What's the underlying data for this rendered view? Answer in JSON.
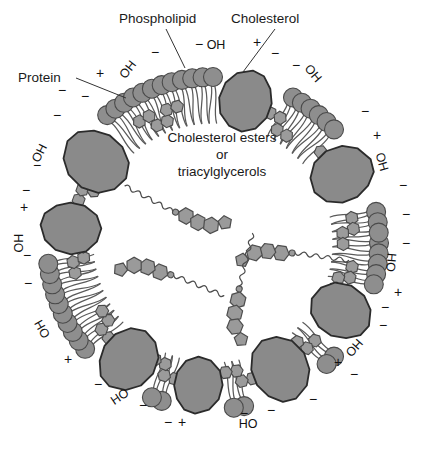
{
  "figure": {
    "kind": "lipoprotein-particle-cross-section",
    "background_color": "#ffffff",
    "colors": {
      "protein_fill": "#8a8a8a",
      "protein_stroke": "#2b2b2b",
      "phospholipid_head_fill": "#8e8e8e",
      "phospholipid_head_stroke": "#4a4a4a",
      "phospholipid_tail_stroke": "#5a5a5a",
      "cholesterol_fill": "#9b9b9b",
      "cholesterol_stroke": "#4a4a4a",
      "ester_fill": "#9a9a9a",
      "ester_stroke": "#4d4d4d",
      "text": "#1a1a1a",
      "leader_line": "#333333"
    },
    "geometry": {
      "center_x": 213,
      "center_y": 243,
      "head_ring_radius": 166,
      "head_radius": 9.5,
      "tail_length": 46
    }
  },
  "callout_labels": [
    {
      "id": "protein",
      "text": "Protein",
      "x": 18,
      "y": 82,
      "leader": "M 76,78 L 126,98"
    },
    {
      "id": "phospholipid",
      "text": "Phospholipid",
      "x": 119,
      "y": 23,
      "leader": "M 166,29 L 185,68"
    },
    {
      "id": "cholesterol",
      "text": "Cholesterol",
      "x": 231,
      "y": 23,
      "leader": "M 275,29 L 243,72"
    }
  ],
  "center_text": {
    "line1": "Cholesterol esters",
    "line2": "or",
    "line3": "triacylglycerols",
    "x": 222,
    "y1": 142,
    "y2": 159,
    "y3": 176
  },
  "hydroxyl_labels": [
    {
      "text": "OH",
      "x": 131,
      "y": 72,
      "rot": -52
    },
    {
      "text": "OH",
      "x": 216,
      "y": 49,
      "rot": 0
    },
    {
      "text": "OH",
      "x": 310,
      "y": 76,
      "rot": 50
    },
    {
      "text": "OH",
      "x": 378,
      "y": 163,
      "rot": 74
    },
    {
      "text": "HO",
      "x": 387,
      "y": 262,
      "rot": 95
    },
    {
      "text": "HO",
      "x": 351,
      "y": 345,
      "rot": 131
    },
    {
      "text": "HO",
      "x": 248,
      "y": 428,
      "rot": 0
    },
    {
      "text": "HO",
      "x": 122,
      "y": 400,
      "rot": -34
    },
    {
      "text": "OH",
      "x": 46,
      "y": 327,
      "rot": -119
    },
    {
      "text": "OH",
      "x": 23,
      "y": 243,
      "rot": -90
    },
    {
      "text": "OH",
      "x": 43,
      "y": 155,
      "rot": -63
    }
  ],
  "charges": [
    {
      "sign": "+",
      "x": 100,
      "y": 78
    },
    {
      "sign": "−",
      "x": 155,
      "y": 57
    },
    {
      "sign": "−",
      "x": 199,
      "y": 49
    },
    {
      "sign": "+",
      "x": 257,
      "y": 47
    },
    {
      "sign": "−",
      "x": 275,
      "y": 58
    },
    {
      "sign": "−",
      "x": 296,
      "y": 70
    },
    {
      "sign": "−",
      "x": 365,
      "y": 116
    },
    {
      "sign": "+",
      "x": 377,
      "y": 140
    },
    {
      "sign": "−",
      "x": 403,
      "y": 190
    },
    {
      "sign": "−",
      "x": 406,
      "y": 219
    },
    {
      "sign": "−",
      "x": 406,
      "y": 248
    },
    {
      "sign": "+",
      "x": 398,
      "y": 297
    },
    {
      "sign": "−",
      "x": 385,
      "y": 312
    },
    {
      "sign": "−",
      "x": 383,
      "y": 330
    },
    {
      "sign": "−",
      "x": 354,
      "y": 379
    },
    {
      "sign": "+",
      "x": 338,
      "y": 367
    },
    {
      "sign": "−",
      "x": 313,
      "y": 404
    },
    {
      "sign": "−",
      "x": 271,
      "y": 415
    },
    {
      "sign": "−",
      "x": 244,
      "y": 418
    },
    {
      "sign": "+",
      "x": 182,
      "y": 427
    },
    {
      "sign": "−",
      "x": 168,
      "y": 427
    },
    {
      "sign": "−",
      "x": 143,
      "y": 410
    },
    {
      "sign": "−",
      "x": 98,
      "y": 389
    },
    {
      "sign": "+",
      "x": 68,
      "y": 364
    },
    {
      "sign": "−",
      "x": 28,
      "y": 288
    },
    {
      "sign": "−",
      "x": 27,
      "y": 260
    },
    {
      "sign": "+",
      "x": 24,
      "y": 212
    },
    {
      "sign": "−",
      "x": 26,
      "y": 195
    },
    {
      "sign": "−",
      "x": 37,
      "y": 170
    },
    {
      "sign": "−",
      "x": 57,
      "y": 120
    },
    {
      "sign": "−",
      "x": 62,
      "y": 95
    },
    {
      "sign": "−",
      "x": 85,
      "y": 101
    }
  ],
  "proteins": [
    {
      "id": "protein-nw",
      "angle_deg": 215,
      "radius": 160,
      "scale": 1.12,
      "rot": -45
    },
    {
      "id": "protein-n",
      "angle_deg": 283,
      "radius": 163,
      "scale": 1.0,
      "rot": 12
    },
    {
      "id": "protein-ne",
      "angle_deg": 332,
      "radius": 163,
      "scale": 1.05,
      "rot": 58
    },
    {
      "id": "protein-e",
      "angle_deg": 28,
      "radius": 162,
      "scale": 1.02,
      "rot": 110
    },
    {
      "id": "protein-se",
      "angle_deg": 62,
      "radius": 160,
      "scale": 1.08,
      "rot": 150
    },
    {
      "id": "protein-s",
      "angle_deg": 96,
      "radius": 160,
      "scale": 0.92,
      "rot": 190
    },
    {
      "id": "protein-sw",
      "angle_deg": 126,
      "radius": 161,
      "scale": 1.06,
      "rot": 222
    },
    {
      "id": "protein-w",
      "angle_deg": 186,
      "radius": 160,
      "scale": 0.98,
      "rot": 275
    }
  ],
  "membrane_cholesterols": [
    {
      "angle_deg": 241,
      "inset": 24
    },
    {
      "angle_deg": 247,
      "inset": 36
    },
    {
      "angle_deg": 253,
      "inset": 25
    },
    {
      "angle_deg": 296,
      "inset": 24
    },
    {
      "angle_deg": 302,
      "inset": 36
    },
    {
      "angle_deg": 322,
      "inset": 25
    },
    {
      "angle_deg": 328,
      "inset": 36
    },
    {
      "angle_deg": 352,
      "inset": 25
    },
    {
      "angle_deg": 358,
      "inset": 36
    },
    {
      "angle_deg": 12,
      "inset": 25
    },
    {
      "angle_deg": 18,
      "inset": 36
    },
    {
      "angle_deg": 46,
      "inset": 25
    },
    {
      "angle_deg": 52,
      "inset": 36
    },
    {
      "angle_deg": 76,
      "inset": 25
    },
    {
      "angle_deg": 82,
      "inset": 36
    },
    {
      "angle_deg": 108,
      "inset": 25
    },
    {
      "angle_deg": 114,
      "inset": 36
    },
    {
      "angle_deg": 140,
      "inset": 25
    },
    {
      "angle_deg": 146,
      "inset": 36
    },
    {
      "angle_deg": 170,
      "inset": 25
    },
    {
      "angle_deg": 176,
      "inset": 36
    },
    {
      "angle_deg": 200,
      "inset": 25
    },
    {
      "angle_deg": 206,
      "inset": 36
    }
  ],
  "interior_esters": [
    {
      "id": "ester-upper-left",
      "x": 186,
      "y": 216,
      "rot": 28,
      "scale": 1.0
    },
    {
      "id": "ester-mid-left",
      "x": 160,
      "y": 272,
      "rot": 202,
      "scale": 1.0
    },
    {
      "id": "ester-right",
      "x": 281,
      "y": 253,
      "rot": 188,
      "scale": 1.0
    },
    {
      "id": "ester-lower-mid",
      "x": 238,
      "y": 300,
      "rot": 104,
      "scale": 1.0
    }
  ]
}
